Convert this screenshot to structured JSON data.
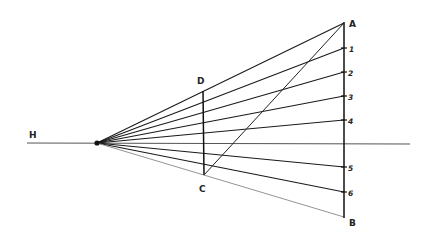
{
  "diagram": {
    "labels": {
      "horizon": "H",
      "top": "A",
      "bottom": "B",
      "near_top": "D",
      "near_bottom": "C",
      "ticks": [
        "1",
        "2",
        "3",
        "4",
        "5",
        "6"
      ]
    },
    "colors": {
      "line": "#1a1a1a",
      "horizon": "#444444",
      "background": "#ffffff"
    }
  }
}
